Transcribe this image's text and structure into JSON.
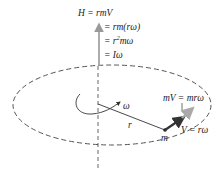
{
  "diagram": {
    "type": "angular-momentum-point-mass",
    "colors": {
      "ink": "#333333",
      "dashed": "#555555",
      "arrow_h": "#999999",
      "arrow_v": "#333333",
      "arrow_mv": "#aaaaaa",
      "background": "#ffffff"
    },
    "equations": {
      "line1": "H = rmV",
      "line2": "= rm(rω)",
      "line3_prefix": "= r",
      "line3_exp": "2",
      "line3_suffix": "mω",
      "line4": "= Iω"
    },
    "labels": {
      "omega": "ω",
      "radius": "r",
      "mass": "m",
      "momentum": "mV = mrω",
      "velocity": "V = rω"
    },
    "elements": {
      "rotation_axis": "vertical dashed axis",
      "orbit": "dashed elliptical path",
      "angular_momentum_vector": "H arrow along axis",
      "radius_line": "r from axis to mass",
      "velocity_vector": "V tangent at mass",
      "momentum_vector": "mV tangent at mass"
    }
  }
}
